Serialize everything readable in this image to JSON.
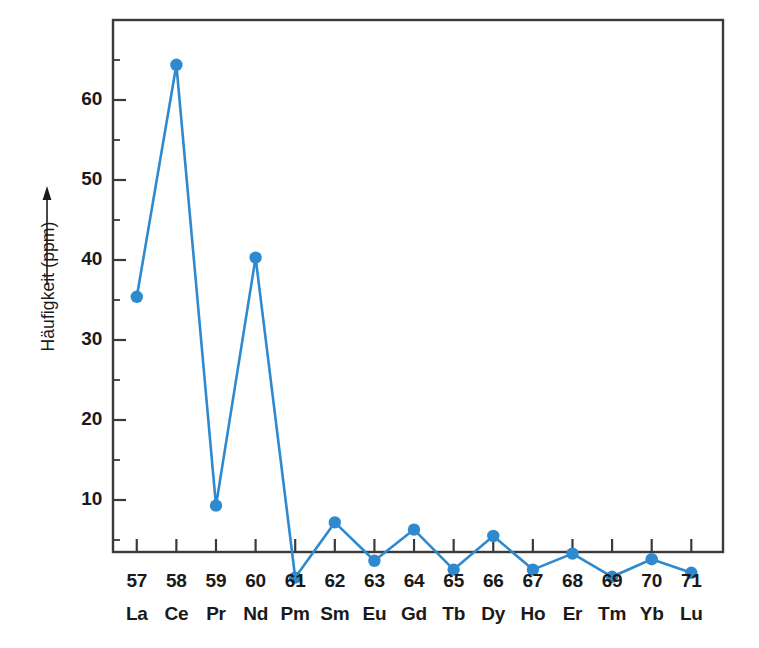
{
  "chart_data": {
    "type": "line",
    "title": "",
    "subtitle": "",
    "xlabel": "",
    "ylabel": "Häufigkeit (ppm)",
    "ylabel_arrow": "↑",
    "xlim": [
      56.4,
      71.8
    ],
    "ylim": [
      0,
      68
    ],
    "grid": false,
    "legend": null,
    "marker": "circle",
    "line_color": "#2e89cf",
    "marker_color": "#2e89cf",
    "axis_color": "#3a3a3a",
    "categories": [
      "57",
      "58",
      "59",
      "60",
      "61",
      "62",
      "63",
      "64",
      "65",
      "66",
      "67",
      "68",
      "69",
      "70",
      "71"
    ],
    "category_symbols": [
      "La",
      "Ce",
      "Pr",
      "Nd",
      "Pm",
      "Sm",
      "Eu",
      "Gd",
      "Tb",
      "Dy",
      "Ho",
      "Er",
      "Tm",
      "Yb",
      "Lu"
    ],
    "x": [
      57,
      58,
      59,
      60,
      61,
      62,
      63,
      64,
      65,
      66,
      67,
      68,
      69,
      70,
      71
    ],
    "values": [
      35.4,
      64.4,
      9.3,
      40.3,
      0.3,
      7.2,
      2.4,
      6.3,
      1.3,
      5.5,
      1.3,
      3.3,
      0.4,
      2.6,
      0.9
    ],
    "yticks": [
      10,
      20,
      30,
      40,
      50,
      60
    ],
    "ytick_labels": [
      "10",
      "20",
      "30",
      "40",
      "50",
      "60"
    ],
    "yminor_ticks": [
      5,
      15,
      25,
      35,
      45,
      55,
      65
    ]
  },
  "axes": {
    "y_axis_name": "Häufigkeit (ppm)",
    "x_axis_row1_name": "atomic-number",
    "x_axis_row2_name": "element-symbol"
  }
}
